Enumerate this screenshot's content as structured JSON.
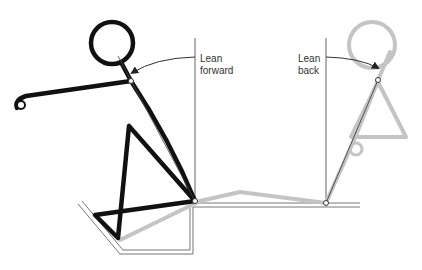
{
  "diagram": {
    "labels": {
      "lean_forward": [
        "Lean",
        "forward"
      ],
      "lean_back": [
        "Lean",
        "back"
      ]
    },
    "colors": {
      "forward_figure": "#111111",
      "back_figure": "#c4c4c4",
      "reference_lines": "#555555",
      "platform": "#666666"
    },
    "figures": [
      {
        "name": "lean-forward-figure",
        "style": "black"
      },
      {
        "name": "lean-back-figure",
        "style": "grey"
      }
    ]
  }
}
